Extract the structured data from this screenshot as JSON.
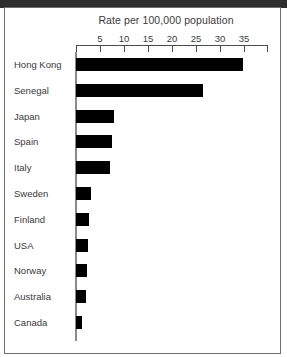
{
  "chart_data": {
    "type": "bar",
    "orientation": "horizontal",
    "title": "Rate per 100,000 population",
    "xlabel": "",
    "ylabel": "",
    "xlim": [
      0,
      37
    ],
    "xticks": [
      5,
      10,
      15,
      20,
      25,
      30,
      35
    ],
    "xtick_labels": [
      "5",
      "10",
      "15",
      "20",
      "25",
      "30",
      "35"
    ],
    "grid": false,
    "legend": false,
    "bar_color": "#000000",
    "axis_color": "#4a4a4a",
    "categories": [
      "Hong Kong",
      "Senegal",
      "Japan",
      "Spain",
      "Italy",
      "Sweden",
      "Finland",
      "USA",
      "Norway",
      "Australia",
      "Canada"
    ],
    "values": [
      34.8,
      26.5,
      8.0,
      7.5,
      7.0,
      3.2,
      2.8,
      2.5,
      2.2,
      2.0,
      1.3
    ]
  }
}
